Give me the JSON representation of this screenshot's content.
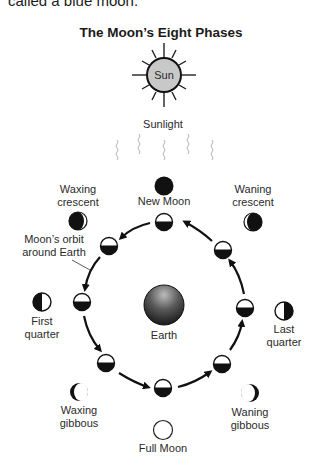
{
  "top_text": "called a blue moon.",
  "title": "The Moon’s Eight Phases",
  "sun": {
    "label": "Sun",
    "fill": "#c8c8c8"
  },
  "sunlight_label": "Sunlight",
  "earth": {
    "label": "Earth"
  },
  "orbit_label": {
    "line1": "Moon’s orbit",
    "line2": "around Earth"
  },
  "phases": [
    {
      "id": "new-moon",
      "line1": "New Moon",
      "line2": ""
    },
    {
      "id": "waxing-crescent",
      "line1": "Waxing",
      "line2": "crescent"
    },
    {
      "id": "first-quarter",
      "line1": "First",
      "line2": "quarter"
    },
    {
      "id": "waxing-gibbous",
      "line1": "Waxing",
      "line2": "gibbous"
    },
    {
      "id": "full-moon",
      "line1": "Full Moon",
      "line2": ""
    },
    {
      "id": "waning-gibbous",
      "line1": "Waning",
      "line2": "gibbous"
    },
    {
      "id": "last-quarter",
      "line1": "Last",
      "line2": "quarter"
    },
    {
      "id": "waning-crescent",
      "line1": "Waning",
      "line2": "crescent"
    }
  ]
}
